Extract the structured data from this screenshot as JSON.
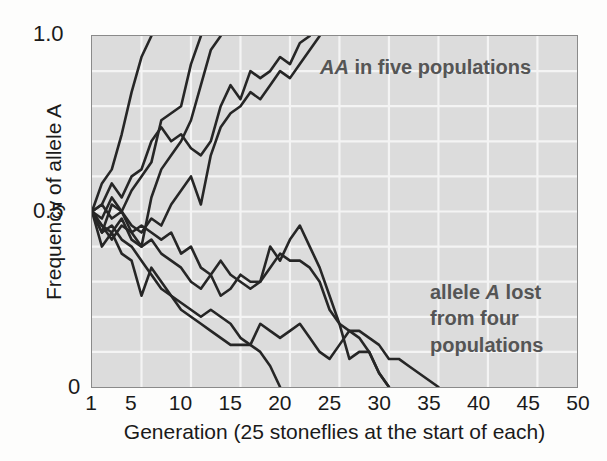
{
  "chart_data": {
    "type": "line",
    "title": "",
    "xlabel": "Generation (25 stoneflies at the start of each)",
    "ylabel": "Frequency of allele A",
    "xlim": [
      1,
      50
    ],
    "ylim": [
      0,
      1.0
    ],
    "xticks": [
      1,
      5,
      10,
      15,
      20,
      25,
      30,
      35,
      40,
      45,
      50
    ],
    "xticklabels": [
      "1",
      "5",
      "10",
      "15",
      "20",
      "25",
      "30",
      "35",
      "40",
      "45",
      "50"
    ],
    "yticks": [
      0,
      0.5,
      1.0
    ],
    "yticklabels": [
      "0",
      "0.5",
      "1.0"
    ],
    "grid": true,
    "grid_x_step": 5,
    "grid_y_step": 0.1,
    "grid_color": "#f4f4f4",
    "plot_bg": "#dcdcdc",
    "line_color": "#262626",
    "legend": "none",
    "annotations": [
      {
        "name": "fixation-note",
        "text": "AA in five populations",
        "italic_part": "AA",
        "plain_part": " in five populations",
        "x": 20.5,
        "y": 0.95
      },
      {
        "name": "loss-note",
        "lines": [
          "allele A lost",
          "from four",
          "populations"
        ],
        "line1_pre": "allele ",
        "line1_italic": "A",
        "line1_post": " lost",
        "line2": "from four",
        "line3": "populations",
        "x": 33,
        "y": 0.3
      }
    ],
    "series": [
      {
        "name": "population-1-fixed",
        "outcome": "fixed",
        "x": [
          1,
          2,
          3,
          4,
          5,
          6,
          7
        ],
        "values": [
          0.5,
          0.58,
          0.62,
          0.72,
          0.84,
          0.94,
          1.0
        ]
      },
      {
        "name": "population-2-fixed",
        "outcome": "fixed",
        "x": [
          1,
          2,
          3,
          4,
          5,
          6,
          7,
          8,
          9,
          10,
          11,
          12
        ],
        "values": [
          0.5,
          0.44,
          0.52,
          0.5,
          0.56,
          0.6,
          0.64,
          0.76,
          0.78,
          0.8,
          0.92,
          1.0
        ]
      },
      {
        "name": "population-3-fixed",
        "outcome": "fixed",
        "x": [
          1,
          2,
          3,
          4,
          5,
          6,
          7,
          8,
          9,
          10,
          11,
          12,
          13,
          14
        ],
        "values": [
          0.5,
          0.46,
          0.42,
          0.46,
          0.44,
          0.4,
          0.54,
          0.62,
          0.66,
          0.7,
          0.76,
          0.86,
          0.96,
          1.0
        ]
      },
      {
        "name": "population-4-fixed",
        "outcome": "fixed",
        "x": [
          1,
          2,
          3,
          4,
          5,
          6,
          7,
          8,
          9,
          10,
          11,
          12,
          13,
          14,
          15,
          16,
          17,
          18,
          19,
          20,
          21,
          22,
          23
        ],
        "values": [
          0.5,
          0.52,
          0.58,
          0.54,
          0.6,
          0.62,
          0.7,
          0.74,
          0.7,
          0.72,
          0.68,
          0.66,
          0.7,
          0.8,
          0.86,
          0.82,
          0.9,
          0.88,
          0.9,
          0.94,
          0.92,
          0.98,
          1.0
        ]
      },
      {
        "name": "population-5-fixed",
        "outcome": "fixed",
        "x": [
          1,
          2,
          3,
          4,
          5,
          6,
          7,
          8,
          9,
          10,
          11,
          12,
          13,
          14,
          15,
          16,
          17,
          18,
          19,
          20,
          21,
          22,
          23,
          24
        ],
        "values": [
          0.5,
          0.48,
          0.54,
          0.5,
          0.46,
          0.44,
          0.48,
          0.46,
          0.52,
          0.56,
          0.6,
          0.52,
          0.66,
          0.74,
          0.78,
          0.8,
          0.84,
          0.82,
          0.86,
          0.9,
          0.88,
          0.92,
          0.96,
          1.0
        ]
      },
      {
        "name": "population-6-lost",
        "outcome": "lost",
        "x": [
          1,
          2,
          3,
          4,
          5,
          6,
          7,
          8,
          9,
          10,
          11,
          12,
          13,
          14,
          15,
          16,
          17,
          18,
          19,
          20
        ],
        "values": [
          0.5,
          0.4,
          0.44,
          0.38,
          0.36,
          0.26,
          0.34,
          0.3,
          0.26,
          0.22,
          0.2,
          0.18,
          0.16,
          0.14,
          0.12,
          0.12,
          0.12,
          0.1,
          0.06,
          0.0
        ]
      },
      {
        "name": "population-7-lost",
        "outcome": "lost",
        "x": [
          1,
          2,
          3,
          4,
          5,
          6,
          7,
          8,
          9,
          10,
          11,
          12,
          13,
          14,
          15,
          16,
          17,
          18,
          19,
          20,
          21,
          22,
          23,
          24,
          25,
          26,
          27,
          28,
          29,
          30,
          31
        ],
        "values": [
          0.5,
          0.52,
          0.48,
          0.5,
          0.44,
          0.46,
          0.44,
          0.42,
          0.44,
          0.38,
          0.4,
          0.34,
          0.32,
          0.36,
          0.32,
          0.3,
          0.28,
          0.3,
          0.34,
          0.38,
          0.36,
          0.36,
          0.34,
          0.3,
          0.22,
          0.18,
          0.16,
          0.14,
          0.1,
          0.04,
          0.0
        ]
      },
      {
        "name": "population-8-lost",
        "outcome": "lost",
        "x": [
          1,
          2,
          3,
          4,
          5,
          6,
          7,
          8,
          9,
          10,
          11,
          12,
          13,
          14,
          15,
          16,
          17,
          18,
          19,
          20,
          21,
          22,
          23,
          24,
          25,
          26,
          27,
          28,
          29,
          30,
          31
        ],
        "values": [
          0.5,
          0.46,
          0.44,
          0.48,
          0.42,
          0.4,
          0.42,
          0.38,
          0.36,
          0.34,
          0.3,
          0.28,
          0.32,
          0.26,
          0.28,
          0.32,
          0.3,
          0.3,
          0.4,
          0.36,
          0.42,
          0.46,
          0.4,
          0.34,
          0.26,
          0.18,
          0.08,
          0.1,
          0.1,
          0.04,
          0.0
        ]
      },
      {
        "name": "population-9-lost",
        "outcome": "lost",
        "x": [
          1,
          2,
          3,
          4,
          5,
          6,
          7,
          8,
          9,
          10,
          11,
          12,
          13,
          14,
          15,
          16,
          17,
          18,
          19,
          20,
          21,
          22,
          23,
          24,
          25,
          26,
          27,
          28,
          29,
          30,
          31,
          32,
          33,
          34,
          35,
          36
        ],
        "values": [
          0.5,
          0.44,
          0.46,
          0.42,
          0.4,
          0.36,
          0.32,
          0.28,
          0.26,
          0.24,
          0.22,
          0.2,
          0.22,
          0.2,
          0.18,
          0.14,
          0.12,
          0.18,
          0.16,
          0.14,
          0.16,
          0.18,
          0.14,
          0.1,
          0.08,
          0.12,
          0.16,
          0.16,
          0.14,
          0.12,
          0.08,
          0.08,
          0.06,
          0.04,
          0.02,
          0.0
        ]
      }
    ]
  }
}
